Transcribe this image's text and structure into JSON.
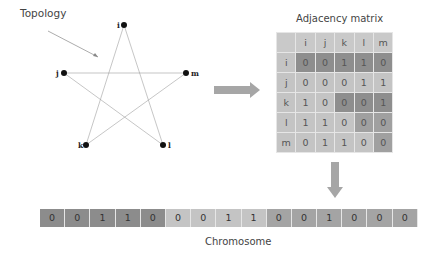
{
  "topology": {
    "label": "Topology",
    "nodes": [
      {
        "id": "i",
        "x": 124,
        "y": 25
      },
      {
        "id": "j",
        "x": 64,
        "y": 73
      },
      {
        "id": "m",
        "x": 186,
        "y": 73
      },
      {
        "id": "k",
        "x": 86,
        "y": 145
      },
      {
        "id": "l",
        "x": 163,
        "y": 145
      }
    ],
    "edges": [
      [
        "i",
        "k"
      ],
      [
        "i",
        "l"
      ],
      [
        "j",
        "m"
      ],
      [
        "j",
        "l"
      ],
      [
        "m",
        "k"
      ]
    ]
  },
  "matrix": {
    "title": "Adjacency matrix",
    "headers": [
      "",
      "i",
      "j",
      "k",
      "l",
      "m"
    ],
    "rows": [
      {
        "label": "i",
        "values": [
          "0",
          "0",
          "1",
          "1",
          "0"
        ]
      },
      {
        "label": "j",
        "values": [
          "0",
          "0",
          "0",
          "1",
          "1"
        ]
      },
      {
        "label": "k",
        "values": [
          "1",
          "0",
          "0",
          "0",
          "1"
        ]
      },
      {
        "label": "l",
        "values": [
          "1",
          "1",
          "0",
          "0",
          "0"
        ]
      },
      {
        "label": "m",
        "values": [
          "0",
          "1",
          "1",
          "0",
          "0"
        ]
      }
    ]
  },
  "chromosome": {
    "label": "Chromosome",
    "genes": [
      "0",
      "0",
      "1",
      "1",
      "0",
      "0",
      "0",
      "1",
      "1",
      "0",
      "0",
      "1",
      "0",
      "0",
      "0"
    ]
  },
  "colors": {
    "dark": "#8c8c8c",
    "mid": "#a4a4a4",
    "light": "#c4c4c4",
    "arrow": "#a6a6a6",
    "edge": "#999999"
  }
}
